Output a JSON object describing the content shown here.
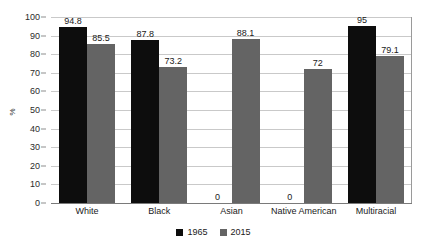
{
  "chart_data": {
    "type": "bar",
    "title": "",
    "subtitle": "",
    "xlabel": "",
    "ylabel": "%",
    "ylim": [
      0,
      100
    ],
    "ytick_step": 10,
    "yticks": [
      100,
      90,
      80,
      70,
      60,
      50,
      40,
      30,
      20,
      10,
      0
    ],
    "grid": "horizontal",
    "legend_position": "bottom-center",
    "categories": [
      "White",
      "Black",
      "Asian",
      "Native American",
      "Multiracial"
    ],
    "series": [
      {
        "name": "1965",
        "color": "#0d0d0d",
        "values": [
          94.8,
          87.8,
          0,
          0,
          95
        ],
        "labels": [
          "94.8",
          "87.8",
          "0",
          "0",
          "95"
        ]
      },
      {
        "name": "2015",
        "color": "#646464",
        "values": [
          85.5,
          73.2,
          88.1,
          72,
          79.1
        ],
        "labels": [
          "85.5",
          "73.2",
          "88.1",
          "72",
          "79.1"
        ]
      }
    ]
  },
  "axis": {
    "y_title": "%",
    "tick_labels": [
      "100",
      "90",
      "80",
      "70",
      "60",
      "50",
      "40",
      "30",
      "20",
      "10",
      "0"
    ]
  },
  "legend": {
    "items": [
      {
        "label": "1965",
        "color": "#0d0d0d"
      },
      {
        "label": "2015",
        "color": "#646464"
      }
    ]
  }
}
